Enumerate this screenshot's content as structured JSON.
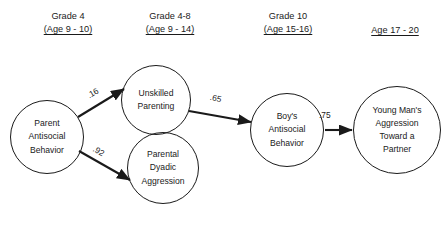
{
  "figure": {
    "background_color": "#ffffff",
    "stroke_color": "#1a1a1a",
    "text_color": "#1a1a1a"
  },
  "headers": [
    {
      "grade": "Grade 4",
      "age": "(Age 9 - 10)",
      "x": 18,
      "y": 10,
      "width": 100,
      "has_grade": true
    },
    {
      "grade": "Grade 4-8",
      "age": "(Age 9 - 14)",
      "x": 120,
      "y": 10,
      "width": 100,
      "has_grade": true
    },
    {
      "grade": "Grade 10",
      "age": "(Age 15-16)",
      "x": 238,
      "y": 10,
      "width": 100,
      "has_grade": true
    },
    {
      "grade": "",
      "age": "Age 17 - 20",
      "x": 345,
      "y": 10,
      "width": 100,
      "has_grade": false
    }
  ],
  "nodes": [
    {
      "id": "parent-antisocial-behavior",
      "lines": [
        "Parent",
        "Antisocial",
        "Behavior"
      ],
      "cx": 47,
      "cy": 137,
      "r": 37
    },
    {
      "id": "unskilled-parenting",
      "lines": [
        "Unskilled",
        "Parenting"
      ],
      "cx": 156,
      "cy": 100,
      "r": 35
    },
    {
      "id": "parental-dyadic-aggression",
      "lines": [
        "Parental",
        "Dyadic",
        "Aggression"
      ],
      "cx": 163,
      "cy": 168,
      "r": 36
    },
    {
      "id": "boys-antisocial-behavior",
      "lines": [
        "Boy's",
        "Antisocial",
        "Behavior"
      ],
      "cx": 287,
      "cy": 130,
      "r": 37
    },
    {
      "id": "young-mans-aggression",
      "lines": [
        "Young Man's",
        "Aggression",
        "Toward a",
        "Partner"
      ],
      "cx": 397,
      "cy": 130,
      "r": 44
    }
  ],
  "edges": [
    {
      "id": "parent-to-unskilled",
      "from": "parent-antisocial-behavior",
      "to": "unskilled-parenting",
      "coefficient": ".16",
      "x1": 78,
      "y1": 117,
      "x2": 124,
      "y2": 89,
      "label_x": 87,
      "label_y": 88,
      "label_rotation": -31
    },
    {
      "id": "parent-to-dyadic",
      "from": "parent-antisocial-behavior",
      "to": "parental-dyadic-aggression",
      "coefficient": ".92",
      "x1": 79,
      "y1": 151,
      "x2": 130,
      "y2": 180,
      "label_x": 93,
      "label_y": 146,
      "label_rotation": 30
    },
    {
      "id": "unskilled-to-boys",
      "from": "unskilled-parenting",
      "to": "boys-antisocial-behavior",
      "coefficient": ".65",
      "x1": 189,
      "y1": 111,
      "x2": 251,
      "y2": 122,
      "label_x": 210,
      "label_y": 93,
      "label_rotation": 12
    },
    {
      "id": "boys-to-young-man",
      "from": "boys-antisocial-behavior",
      "to": "young-mans-aggression",
      "coefficient": ".75",
      "x1": 325,
      "y1": 130,
      "x2": 352,
      "y2": 130,
      "label_x": 319,
      "label_y": 110,
      "label_rotation": 0
    }
  ]
}
